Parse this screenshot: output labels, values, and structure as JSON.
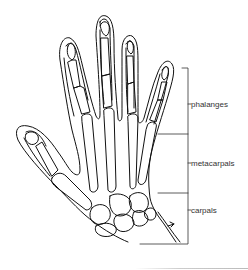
{
  "figure": {
    "stroke_color": "#111111",
    "label_color": "#333333",
    "labels": [
      {
        "id": "phalanges",
        "text": "phalanges"
      },
      {
        "id": "metacarpals",
        "text": "metacarpals"
      },
      {
        "id": "carpals",
        "text": "carpals"
      }
    ]
  }
}
